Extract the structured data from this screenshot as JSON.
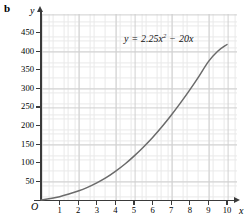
{
  "figure": {
    "part_label": "b"
  },
  "chart_data": {
    "type": "line",
    "title": "",
    "subtitle": "",
    "equation": "y = 2.25x² − 20x",
    "equation_parts": {
      "lhs": "y",
      "equals": "=",
      "coef_quad": "2.25",
      "var_quad": "x",
      "exponent": "2",
      "minus": "−",
      "coef_lin": "20",
      "var_lin": "x"
    },
    "xlabel": "x",
    "ylabel": "y",
    "origin_label": "O",
    "xlim": [
      0,
      10.6
    ],
    "ylim": [
      0,
      475
    ],
    "x_ticks": [
      1,
      2,
      3,
      4,
      5,
      6,
      7,
      8,
      9,
      10
    ],
    "x_tick_labels": [
      "1",
      "2",
      "3",
      "4",
      "5",
      "6",
      "7",
      "8",
      "9",
      "10"
    ],
    "y_ticks": [
      50,
      100,
      150,
      200,
      250,
      300,
      350,
      400,
      450
    ],
    "y_tick_labels": [
      "50",
      "100",
      "150",
      "200",
      "250",
      "300",
      "350",
      "400",
      "450"
    ],
    "grid": true,
    "grid_minor": true,
    "grid_major_step_x": 1,
    "grid_major_step_y": 50,
    "grid_minor_divisions": 5,
    "legend": "none",
    "series": [
      {
        "name": "y = 2.25x² − 20x",
        "color": "#6b6b6b",
        "points": [
          {
            "x": 0.0,
            "y": 0
          },
          {
            "x": 0.5,
            "y": -9.44
          },
          {
            "x": 1.0,
            "y": -17.75
          },
          {
            "x": 1.5,
            "y": -24.94
          },
          {
            "x": 2.0,
            "y": -31.0
          },
          {
            "x": 2.5,
            "y": -35.94
          },
          {
            "x": 3.0,
            "y": -39.75
          },
          {
            "x": 3.5,
            "y": -42.44
          },
          {
            "x": 4.0,
            "y": -44.0
          },
          {
            "x": 4.5,
            "y": -44.44
          },
          {
            "x": 5.0,
            "y": -43.75
          },
          {
            "x": 5.5,
            "y": -41.94
          },
          {
            "x": 6.0,
            "y": -39.0
          },
          {
            "x": 6.5,
            "y": -34.94
          },
          {
            "x": 7.0,
            "y": -29.75
          },
          {
            "x": 7.5,
            "y": -23.44
          },
          {
            "x": 8.0,
            "y": -16.0
          },
          {
            "x": 8.5,
            "y": -7.44
          },
          {
            "x": 9.0,
            "y": 2.25
          },
          {
            "x": 9.5,
            "y": 13.06
          },
          {
            "x": 10.0,
            "y": 25.0
          }
        ],
        "drawn_curve_points": [
          {
            "x": 0.0,
            "y": 0
          },
          {
            "x": 0.5,
            "y": 4
          },
          {
            "x": 1.0,
            "y": 9
          },
          {
            "x": 1.5,
            "y": 16
          },
          {
            "x": 2.0,
            "y": 24
          },
          {
            "x": 2.5,
            "y": 34
          },
          {
            "x": 3.0,
            "y": 46
          },
          {
            "x": 3.5,
            "y": 60
          },
          {
            "x": 4.0,
            "y": 77
          },
          {
            "x": 4.5,
            "y": 96
          },
          {
            "x": 5.0,
            "y": 118
          },
          {
            "x": 5.5,
            "y": 142
          },
          {
            "x": 6.0,
            "y": 168
          },
          {
            "x": 6.5,
            "y": 197
          },
          {
            "x": 7.0,
            "y": 228
          },
          {
            "x": 7.5,
            "y": 261
          },
          {
            "x": 8.0,
            "y": 296
          },
          {
            "x": 8.5,
            "y": 333
          },
          {
            "x": 9.0,
            "y": 372
          },
          {
            "x": 9.5,
            "y": 400
          },
          {
            "x": 10.0,
            "y": 418
          }
        ]
      }
    ]
  }
}
